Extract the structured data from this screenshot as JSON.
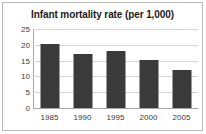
{
  "chart_data": {
    "type": "bar",
    "title": "Infant mortality rate (per 1,000)",
    "categories": [
      "1985",
      "1990",
      "1995",
      "2000",
      "2005"
    ],
    "values": [
      20.2,
      17.2,
      18.0,
      15.2,
      12.1
    ],
    "xlabel": "",
    "ylabel": "",
    "ylim": [
      0,
      25
    ],
    "yticks": [
      0,
      5,
      10,
      15,
      20,
      25
    ],
    "ytick_labels": [
      "0",
      "5",
      "10",
      "15",
      "20",
      "25"
    ],
    "grid": true,
    "legend": false,
    "colors": {
      "bar": "#3a3a3a",
      "gridline": "#d6d6d6",
      "axis": "#a8a8a8",
      "frame": "#b9b9b9",
      "background": "#ffffff",
      "text": "#3c3c3c",
      "title_text": "#1b1b1b"
    }
  }
}
